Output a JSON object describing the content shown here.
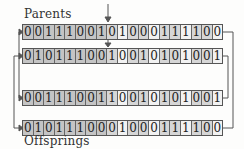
{
  "labels": {
    "top": "Parents",
    "bottom": "Offsprings"
  },
  "crossover_point": 8,
  "colors": {
    "dark_cell": "#c4c4c4",
    "mid_cell": "#d6d6d6",
    "light_cell": "#f2f2f2",
    "line": "#555555"
  },
  "rows": [
    {
      "name": "parent-1",
      "bits": [
        0,
        0,
        1,
        1,
        1,
        0,
        0,
        1,
        0,
        1,
        0,
        0,
        0,
        1,
        1,
        1,
        1,
        0,
        0
      ]
    },
    {
      "name": "parent-2",
      "bits": [
        0,
        1,
        0,
        1,
        1,
        1,
        0,
        0,
        1,
        0,
        0,
        1,
        0,
        1,
        0,
        1,
        0,
        0,
        1
      ]
    },
    {
      "name": "offspring-1",
      "bits": [
        0,
        0,
        1,
        1,
        1,
        0,
        0,
        1,
        1,
        0,
        0,
        1,
        0,
        1,
        0,
        1,
        0,
        0,
        1
      ]
    },
    {
      "name": "offspring-2",
      "bits": [
        0,
        1,
        0,
        1,
        1,
        1,
        0,
        0,
        0,
        1,
        0,
        0,
        0,
        1,
        1,
        1,
        1,
        0,
        0
      ]
    }
  ]
}
